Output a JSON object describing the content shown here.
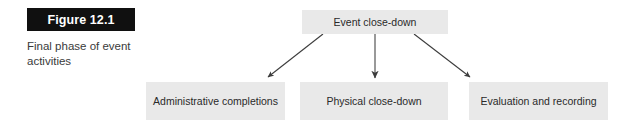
{
  "figure": {
    "label": "Figure 12.1",
    "caption": "Final phase of event activities",
    "label_bg": "#101010",
    "label_fg": "#ffffff",
    "caption_color": "#3a3a3a"
  },
  "diagram": {
    "type": "flowchart",
    "orientation": "top-down",
    "node_fill": "#e9e9e9",
    "node_text_color": "#2a2a2a",
    "arrow_color": "#3c3c3c",
    "root": {
      "id": "event-close-down",
      "label": "Event close-down"
    },
    "children": [
      {
        "id": "administrative-completions",
        "label": "Administrative completions"
      },
      {
        "id": "physical-close-down",
        "label": "Physical close-down"
      },
      {
        "id": "evaluation-and-recording",
        "label": "Evaluation and recording"
      }
    ],
    "edges": [
      {
        "from": "event-close-down",
        "to": "administrative-completions",
        "style": "arrow"
      },
      {
        "from": "event-close-down",
        "to": "physical-close-down",
        "style": "arrow"
      },
      {
        "from": "event-close-down",
        "to": "evaluation-and-recording",
        "style": "arrow"
      }
    ]
  }
}
